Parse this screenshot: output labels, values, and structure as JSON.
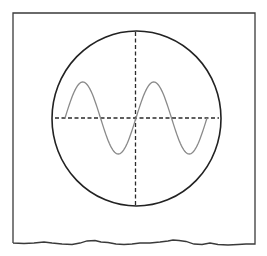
{
  "figure": {
    "colors": {
      "background": "#ffffff",
      "frame": "#3a3a3a",
      "screen_outline": "#222222",
      "axes": "#2a2a2a",
      "waveform": "#8a8a8a"
    },
    "frame": {
      "left": 13,
      "top": 13,
      "right": 255,
      "bottom": 243,
      "bottom_edge_style": "torn-wavy"
    },
    "screen": {
      "cx": 136.5,
      "cy": 118.5,
      "rx": 84.5,
      "ry": 87.5
    },
    "crosshair": {
      "horizontal": {
        "y": 118,
        "x1": 55,
        "x2": 219,
        "style": "dashed"
      },
      "vertical": {
        "x": 135.5,
        "y1": 32,
        "y2": 205,
        "style": "dashed"
      }
    },
    "waveform": {
      "type": "sine",
      "cycles": 2,
      "start_x": 65,
      "end_x": 207,
      "baseline_y": 118,
      "amplitude": 36,
      "key_points": [
        {
          "x": 65,
          "y": 118,
          "label": "start"
        },
        {
          "x": 82,
          "y": 83,
          "label": "peak-1"
        },
        {
          "x": 99,
          "y": 118,
          "label": "zero-1"
        },
        {
          "x": 117,
          "y": 156,
          "label": "trough-1"
        },
        {
          "x": 136,
          "y": 118,
          "label": "zero-2"
        },
        {
          "x": 154,
          "y": 83,
          "label": "peak-2"
        },
        {
          "x": 171,
          "y": 118,
          "label": "zero-3"
        },
        {
          "x": 188,
          "y": 156,
          "label": "trough-2"
        },
        {
          "x": 207,
          "y": 118,
          "label": "end"
        }
      ]
    }
  }
}
